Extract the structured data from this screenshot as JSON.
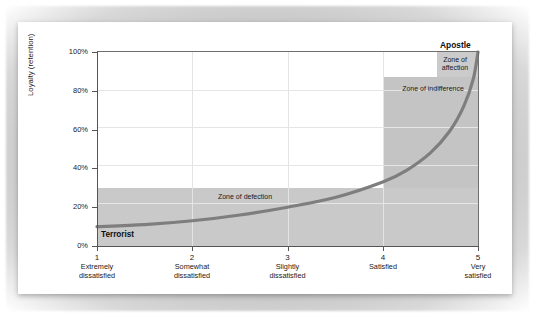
{
  "chart_data": {
    "type": "line",
    "title": "",
    "subtitle": "",
    "xlabel": "",
    "ylabel": "Loyalty (retention)",
    "xlim": [
      1,
      5
    ],
    "ylim": [
      0,
      100
    ],
    "grid": true,
    "legend_position": "none",
    "x_tick_values": [
      1,
      2,
      3,
      4,
      5
    ],
    "x_tick_numbers": [
      "1",
      "2",
      "3",
      "4",
      "5"
    ],
    "x_tick_descriptions": [
      "Extremely\ndissatisfied",
      "Somewhat\ndissatisfied",
      "Slightly\ndissatisfied",
      "Satisfied",
      "Very\nsatisfied"
    ],
    "x_ticks": [
      {
        "num": "1",
        "line1": "Extremely",
        "line2": "dissatisfied"
      },
      {
        "num": "2",
        "line1": "Somewhat",
        "line2": "dissatisfied"
      },
      {
        "num": "3",
        "line1": "Slightly",
        "line2": "dissatisfied"
      },
      {
        "num": "4",
        "line1": "Satisfied",
        "line2": ""
      },
      {
        "num": "5",
        "line1": "Very",
        "line2": "satisfied"
      }
    ],
    "y_tick_values": [
      0,
      20,
      40,
      60,
      80,
      100
    ],
    "y_tick_labels": [
      "0%",
      "20%",
      "40%",
      "60%",
      "80%",
      "100%"
    ],
    "series": [
      {
        "name": "Satisfaction-loyalty curve",
        "color": "#7e7e7e",
        "x": [
          1.0,
          1.5,
          2.0,
          2.5,
          3.0,
          3.5,
          4.0,
          4.25,
          4.5,
          4.7,
          4.85,
          4.95,
          5.0
        ],
        "values": [
          10,
          11,
          13,
          16,
          20,
          25,
          33,
          39,
          48,
          59,
          72,
          86,
          100
        ]
      }
    ],
    "zones": [
      {
        "name": "zone-of-defection",
        "label": "Zone of defection",
        "x_range": [
          1,
          5
        ],
        "y_range": [
          0,
          30
        ],
        "color": "#c9c9c9"
      },
      {
        "name": "zone-of-indifference",
        "label": "Zone of indifference",
        "x_range": [
          4,
          5
        ],
        "y_range": [
          30,
          87
        ],
        "color": "#c4c4c4"
      },
      {
        "name": "zone-of-affection",
        "label": "Zone of affection",
        "x_range": [
          4.57,
          5
        ],
        "y_range": [
          87,
          100
        ],
        "color": "#cbcbcb"
      }
    ],
    "annotations": [
      {
        "name": "terrorist",
        "text": "Terrorist",
        "x": 1.05,
        "y": 7,
        "bold": true
      },
      {
        "name": "apostle",
        "text": "Apostle",
        "x": 4.95,
        "y": 106,
        "bold": true
      }
    ]
  },
  "figure": {
    "y_axis_label": "Loyalty (retention)",
    "y_ticks": [
      "100%",
      "80%",
      "60%",
      "40%",
      "20%",
      "0%"
    ],
    "x_ticks": [
      {
        "num": "1",
        "line1": "Extremely",
        "line2": "dissatisfied"
      },
      {
        "num": "2",
        "line1": "Somewhat",
        "line2": "dissatisfied"
      },
      {
        "num": "3",
        "line1": "Slightly",
        "line2": "dissatisfied"
      },
      {
        "num": "4",
        "line1": "Satisfied",
        "line2": ""
      },
      {
        "num": "5",
        "line1": "Very",
        "line2": "satisfied"
      }
    ],
    "zone_defection_label": "Zone of defection",
    "zone_indifference_label": "Zone of indifference",
    "zone_affection_line1": "Zone of",
    "zone_affection_line2": "affection",
    "terrorist_label": "Terrorist",
    "apostle_label": "Apostle"
  },
  "colors": {
    "curve": "#7e7e7e",
    "zone_defection": "#c9c9c9",
    "zone_indifference": "#c4c4c4",
    "zone_affection": "#cbcbcb",
    "axis": "#555555",
    "gridline": "#e6e6e6",
    "card_background": "#ffffff",
    "mat_background": "#c2c2c2",
    "text": "#1a1a1a"
  }
}
